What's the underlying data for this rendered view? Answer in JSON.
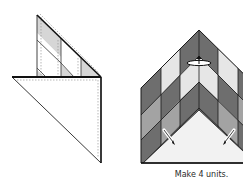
{
  "caption": "Make 4 units.",
  "colors": {
    "dark": "#6e6e6e",
    "medium": "#a3a3a3",
    "light": "#e6e6e6",
    "white": "#ffffff",
    "fabric_light_gray": "#d9d9d9",
    "outline": "#1a1a1a",
    "stitch": "#8a8a8a"
  },
  "figures": [
    {
      "name": "folded-triangle-step",
      "description": "Pieced strip triangle placed on large background triangle, stitching lines shown dashed"
    },
    {
      "name": "chevron-unit-result",
      "description": "Pressed chevron unit with pieced rows and background triangle, press-direction arrows"
    }
  ]
}
